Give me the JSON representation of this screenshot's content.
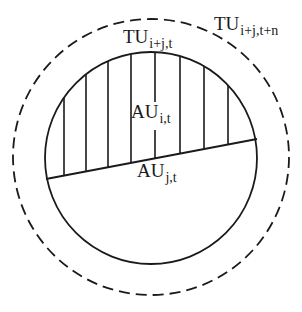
{
  "diagram": {
    "type": "nested-circles-set-diagram",
    "outer_circle": {
      "name": "TU",
      "subscript": "i+j,t+n",
      "style": "dashed",
      "cx": 151,
      "cy": 157,
      "r": 138
    },
    "inner_circle": {
      "name": "TU",
      "subscript": "i+j,t",
      "style": "solid",
      "cx": 151,
      "cy": 158,
      "r": 106
    },
    "chord": {
      "x1": 46,
      "y1": 179,
      "x2": 257,
      "y2": 139
    },
    "hatched_region": {
      "name": "AU",
      "subscript": "i,t",
      "hatch": "vertical",
      "hatch_x": [
        64,
        86,
        108,
        131,
        155,
        180,
        204,
        228
      ]
    },
    "lower_region": {
      "name": "AU",
      "subscript": "j,t"
    },
    "stroke_color": "#1a1a1a",
    "background_color": "#ffffff"
  },
  "labels": {
    "outer": {
      "main": "TU",
      "sub": "i+j,t+n"
    },
    "inner": {
      "main": "TU",
      "sub": "i+j,t"
    },
    "hatched": {
      "main": "AU",
      "sub": "i,t"
    },
    "lower": {
      "main": "AU",
      "sub": "j,t"
    }
  }
}
